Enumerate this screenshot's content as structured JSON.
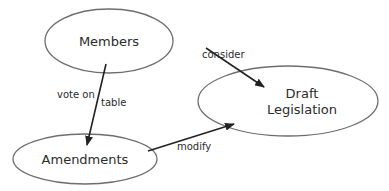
{
  "diagram": {
    "type": "concept-map",
    "colors": {
      "node_stroke": "#6e6e6e",
      "edge": "#222222",
      "text": "#2b2b2b",
      "background": "#ffffff"
    },
    "nodes": [
      {
        "id": "members",
        "label": "Members",
        "cx": 109,
        "cy": 41,
        "rx": 64,
        "ry": 32
      },
      {
        "id": "draft",
        "label_lines": [
          "Draft",
          "Legislation"
        ],
        "cx": 288,
        "cy": 101,
        "rx": 90,
        "ry": 35
      },
      {
        "id": "amendments",
        "label": "Amendments",
        "cx": 85,
        "cy": 159,
        "rx": 72,
        "ry": 25
      }
    ],
    "edges": [
      {
        "from": "members",
        "to": "draft",
        "label": "consider"
      },
      {
        "from": "members",
        "to": "amendments",
        "labels": [
          "vote on",
          "table"
        ]
      },
      {
        "from": "amendments",
        "to": "draft",
        "label": "modify"
      }
    ]
  }
}
